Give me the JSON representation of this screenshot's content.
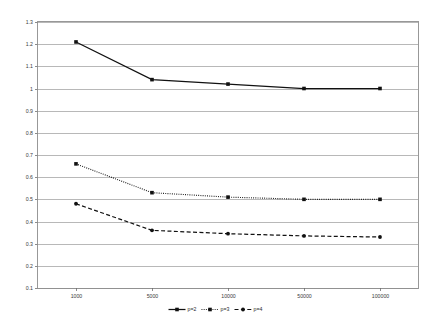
{
  "chart_data": {
    "type": "line",
    "title": "",
    "subtitle": "",
    "xlabel": "",
    "ylabel": "",
    "x": [
      1000,
      5000,
      10000,
      50000,
      100000
    ],
    "xtick_labels": [
      "1000",
      "5000",
      "10000",
      "50000",
      "100000"
    ],
    "ytick_labels": [
      "0.1",
      "0.2",
      "0.3",
      "0.4",
      "0.5",
      "0.6",
      "0.7",
      "0.8",
      "0.9",
      "1",
      "1.1",
      "1.2",
      "1.3"
    ],
    "ytick_values": [
      0.1,
      0.2,
      0.3,
      0.4,
      0.5,
      0.6,
      0.7,
      0.8,
      0.9,
      1.0,
      1.1,
      1.2,
      1.3
    ],
    "ylim": [
      0.1,
      1.3
    ],
    "grid": "horizontal",
    "legend_position": "bottom",
    "series": [
      {
        "name": "p=2",
        "style": "solid",
        "marker": "square",
        "color": "#111111",
        "values": [
          1.21,
          1.04,
          1.02,
          1.0,
          1.0
        ]
      },
      {
        "name": "p=3",
        "style": "dotted",
        "marker": "square",
        "color": "#111111",
        "values": [
          0.66,
          0.53,
          0.51,
          0.5,
          0.5
        ]
      },
      {
        "name": "p=4",
        "style": "dashed",
        "marker": "circle",
        "color": "#111111",
        "values": [
          0.48,
          0.36,
          0.345,
          0.335,
          0.33
        ]
      }
    ]
  },
  "legend": {
    "entries": [
      {
        "label": "p=2"
      },
      {
        "label": "p=3"
      },
      {
        "label": "p=4"
      }
    ]
  },
  "colors": {
    "gridline": "#9a9a9a",
    "axis": "#6e6e6e",
    "series": "#111111",
    "background": "#ffffff"
  }
}
